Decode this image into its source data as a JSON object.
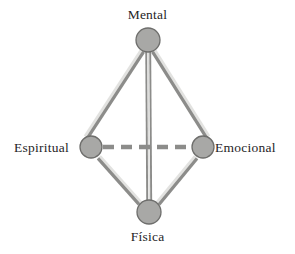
{
  "diagram": {
    "title_visible": false,
    "type": "node-link-diagram",
    "shape": "rhombus",
    "background_color": "#ffffff",
    "node_fill_color": "#a8a8a6",
    "node_stroke_color": "#6e6e6c",
    "edge_color": "#8c8c8a",
    "edge_highlight_color": "#d9d9d7",
    "label_color": "#26241f",
    "nodes": [
      {
        "id": "mental",
        "label": "Mental",
        "x": 148,
        "y": 40,
        "r": 12,
        "label_position": "top"
      },
      {
        "id": "espiritual",
        "label": "Espiritual",
        "x": 91,
        "y": 147,
        "r": 11,
        "label_position": "left"
      },
      {
        "id": "emocional",
        "label": "Emocional",
        "x": 203,
        "y": 147,
        "r": 11,
        "label_position": "right"
      },
      {
        "id": "fisica",
        "label": "Física",
        "x": 149,
        "y": 212,
        "r": 12,
        "label_position": "bottom"
      }
    ],
    "edges": [
      {
        "from": "mental",
        "to": "espiritual",
        "style": "double-solid"
      },
      {
        "from": "mental",
        "to": "emocional",
        "style": "double-solid"
      },
      {
        "from": "mental",
        "to": "fisica",
        "style": "double-solid-vertical"
      },
      {
        "from": "espiritual",
        "to": "fisica",
        "style": "double-solid"
      },
      {
        "from": "emocional",
        "to": "fisica",
        "style": "double-solid"
      },
      {
        "from": "espiritual",
        "to": "emocional",
        "style": "dashed"
      }
    ]
  },
  "labels": {
    "mental": "Mental",
    "espiritual": "Espiritual",
    "emocional": "Emocional",
    "fisica": "Física"
  }
}
